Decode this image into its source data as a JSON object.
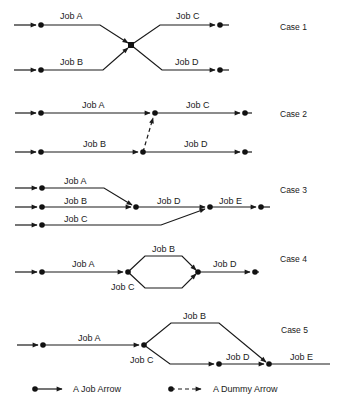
{
  "diagram": {
    "type": "activity-on-arrow network examples",
    "cases": [
      {
        "label": "Case 1",
        "jobs": [
          "Job A",
          "Job B",
          "Job C",
          "Job D"
        ]
      },
      {
        "label": "Case 2",
        "jobs": [
          "Job A",
          "Job B",
          "Job C",
          "Job D"
        ]
      },
      {
        "label": "Case 3",
        "jobs": [
          "Job A",
          "Job B",
          "Job C",
          "Job D",
          "Job E"
        ]
      },
      {
        "label": "Case 4",
        "jobs": [
          "Job A",
          "Job B",
          "Job C",
          "Job D"
        ]
      },
      {
        "label": "Case 5",
        "jobs": [
          "Job A",
          "Job B",
          "Job C",
          "Job D",
          "Job E"
        ]
      }
    ],
    "legend": {
      "job_arrow": "A Job Arrow",
      "dummy_arrow": "A Dummy Arrow"
    },
    "colors": {
      "ink": "#1a1a1a",
      "background": "#ffffff"
    }
  }
}
